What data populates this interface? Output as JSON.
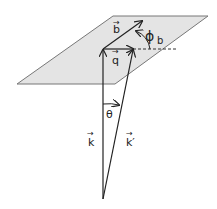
{
  "diagram": {
    "colors": {
      "plane_fill": "#e4e4e4",
      "plane_stroke": "#777777",
      "line": "#222222"
    },
    "labels": {
      "b": "b",
      "q": "q",
      "k": "k",
      "k_prime": "k′",
      "theta": "θ",
      "phi": "ϕ",
      "phi_sub": "b",
      "vec_arrow": "→"
    }
  }
}
